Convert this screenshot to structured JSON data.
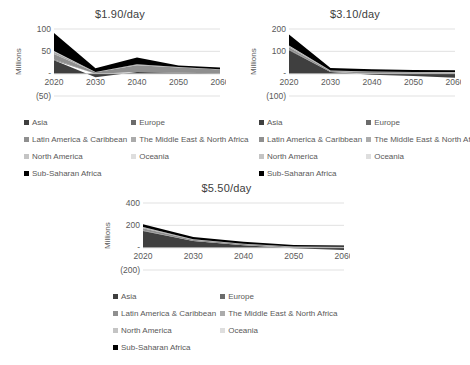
{
  "page": {
    "background": "#ffffff",
    "text_color": "#595959",
    "grid_color": "#d9d9d9"
  },
  "chart_data": [
    {
      "type": "area",
      "stacked": true,
      "title": "$1.90/day",
      "ylabel": "Millions",
      "x_labels": [
        "2020",
        "2030",
        "2040",
        "2050",
        "2060"
      ],
      "ylim": [
        -50,
        100
      ],
      "ytick_values": [
        100,
        50,
        0,
        -50
      ],
      "ytick_labels": [
        "100",
        "50",
        "-",
        "(50)"
      ],
      "grid": true,
      "legend_position": "bottom",
      "series": [
        {
          "name": "Asia",
          "color": "#3f3f3f",
          "values": [
            30,
            -8,
            4,
            2,
            1
          ]
        },
        {
          "name": "Europe",
          "color": "#6b6b6b",
          "values": [
            2,
            0,
            0,
            0,
            0
          ]
        },
        {
          "name": "Latin America & Caribbean",
          "color": "#8f8f8f",
          "values": [
            12,
            3,
            15,
            12,
            8
          ]
        },
        {
          "name": "The Middle East & North Africa",
          "color": "#ababab",
          "values": [
            5,
            1,
            2,
            1,
            1
          ]
        },
        {
          "name": "North America",
          "color": "#c4c4c4",
          "values": [
            1,
            0,
            0,
            0,
            0
          ]
        },
        {
          "name": "Oceania",
          "color": "#dedede",
          "values": [
            1,
            0,
            0,
            0,
            0
          ]
        },
        {
          "name": "Sub-Saharan Africa",
          "color": "#000000",
          "values": [
            40,
            8,
            15,
            3,
            4
          ]
        }
      ]
    },
    {
      "type": "area",
      "stacked": true,
      "title": "$3.10/day",
      "ylabel": "Millions",
      "x_labels": [
        "2020",
        "2030",
        "2040",
        "2050",
        "2060"
      ],
      "ylim": [
        -100,
        200
      ],
      "ytick_values": [
        200,
        100,
        0,
        -100
      ],
      "ytick_labels": [
        "200",
        "100",
        "-",
        "(100)"
      ],
      "grid": true,
      "legend_position": "bottom",
      "series": [
        {
          "name": "Asia",
          "color": "#3f3f3f",
          "values": [
            105,
            8,
            -5,
            -10,
            -18
          ]
        },
        {
          "name": "Europe",
          "color": "#6b6b6b",
          "values": [
            3,
            0,
            0,
            0,
            0
          ]
        },
        {
          "name": "Latin America & Caribbean",
          "color": "#8f8f8f",
          "values": [
            10,
            4,
            8,
            6,
            5
          ]
        },
        {
          "name": "The Middle East & North Africa",
          "color": "#ababab",
          "values": [
            6,
            2,
            2,
            2,
            2
          ]
        },
        {
          "name": "North America",
          "color": "#c4c4c4",
          "values": [
            1,
            0,
            0,
            0,
            0
          ]
        },
        {
          "name": "Oceania",
          "color": "#dedede",
          "values": [
            1,
            0,
            0,
            0,
            0
          ]
        },
        {
          "name": "Sub-Saharan Africa",
          "color": "#000000",
          "values": [
            50,
            12,
            10,
            8,
            8
          ]
        }
      ]
    },
    {
      "type": "area",
      "stacked": true,
      "title": "$5.50/day",
      "ylabel": "Millions",
      "x_labels": [
        "2020",
        "2030",
        "2040",
        "2050",
        "2060"
      ],
      "ylim": [
        -200,
        400
      ],
      "ytick_values": [
        400,
        200,
        0,
        -200
      ],
      "ytick_labels": [
        "400",
        "200",
        "-",
        "(200)"
      ],
      "grid": true,
      "legend_position": "bottom",
      "series": [
        {
          "name": "Asia",
          "color": "#3f3f3f",
          "values": [
            150,
            60,
            22,
            -5,
            -20
          ]
        },
        {
          "name": "Europe",
          "color": "#6b6b6b",
          "values": [
            4,
            1,
            0,
            0,
            0
          ]
        },
        {
          "name": "Latin America & Caribbean",
          "color": "#8f8f8f",
          "values": [
            20,
            10,
            10,
            8,
            6
          ]
        },
        {
          "name": "The Middle East & North Africa",
          "color": "#ababab",
          "values": [
            8,
            4,
            3,
            2,
            2
          ]
        },
        {
          "name": "North America",
          "color": "#c4c4c4",
          "values": [
            2,
            1,
            0,
            0,
            0
          ]
        },
        {
          "name": "Oceania",
          "color": "#dedede",
          "values": [
            1,
            0,
            0,
            0,
            0
          ]
        },
        {
          "name": "Sub-Saharan Africa",
          "color": "#000000",
          "values": [
            25,
            19,
            18,
            15,
            12
          ]
        }
      ]
    }
  ]
}
